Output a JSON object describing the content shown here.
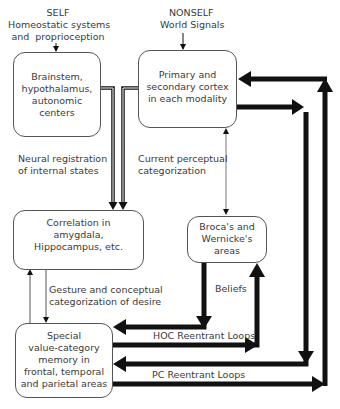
{
  "header": {
    "self": {
      "title": "SELF",
      "line1": "Homeostatic systems",
      "line2": "and  proprioception"
    },
    "nonself": {
      "title": "NONSELF",
      "line1": "World Signals"
    }
  },
  "nodes": {
    "brainstem": [
      "Brainstem,",
      "hypothalamus,",
      "autonomic",
      "centers"
    ],
    "cortex": [
      "Primary and",
      "secondary cortex",
      "in each modality"
    ],
    "correlation": [
      "Correlation in",
      "amygdala,",
      "Hippocampus, etc."
    ],
    "broca": [
      "Broca's and",
      "Wernicke's",
      "areas"
    ],
    "memory": [
      "Special",
      "value-category",
      "memory in",
      "frontal, temporal",
      "and parietal areas"
    ]
  },
  "edge_labels": {
    "neural_registration": [
      "Neural registration",
      "of internal states"
    ],
    "current_perceptual": [
      "Current perceptual",
      "categorization"
    ],
    "gesture": [
      "Gesture and conceptual",
      "categorization of desire"
    ],
    "beliefs": "Beliefs",
    "hoc_loops": "HOC Reentrant Loops",
    "pc_loops": "PC Reentrant Loops"
  },
  "colors": {
    "line": "#111111",
    "box_border": "#555555",
    "text": "#3a3a3a"
  }
}
